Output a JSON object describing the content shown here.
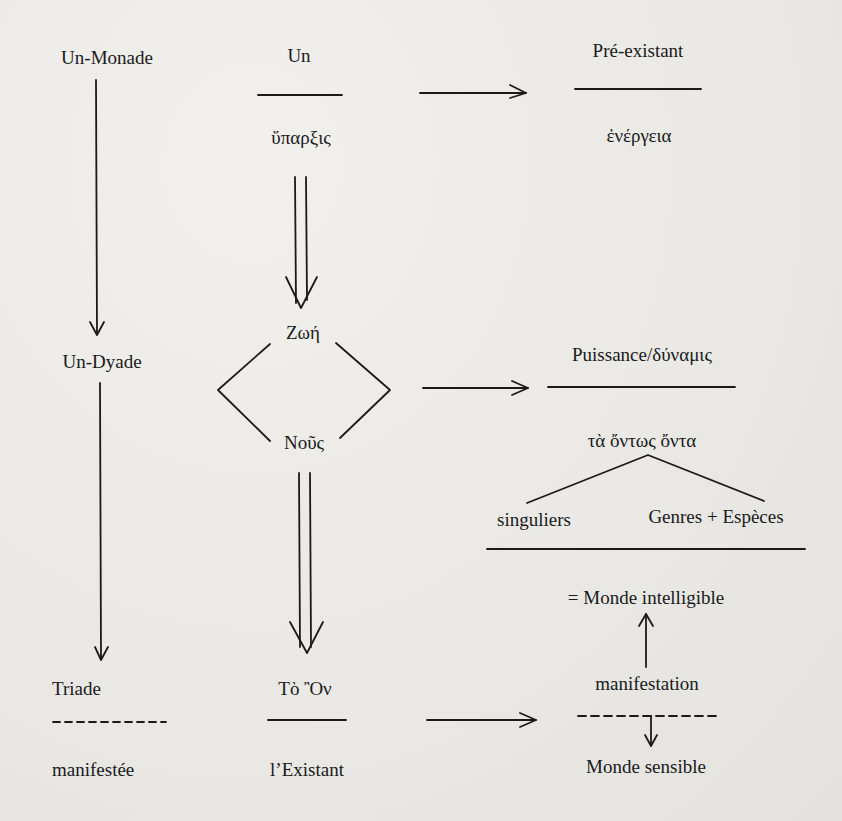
{
  "left_column": {
    "level1": "Un-Monade",
    "level2": "Un-Dyade",
    "level3_top": "Triade",
    "level3_bottom": "manifestée"
  },
  "middle_column": {
    "un_numerator": "Un",
    "un_denominator": "ὕπαρξις",
    "zoe": "Ζωή",
    "nous": "Νοῦς",
    "on_numerator": "Τὸ Ὂν",
    "on_denominator": "l’Existant"
  },
  "right_column": {
    "preexistant_numerator": "Pré-existant",
    "preexistant_denominator": "ἐνέργεια",
    "puissance_numerator": "Puissance/δύναμις",
    "ontos_onta": "τὰ ὄντως ὄντα",
    "branch_left": "singuliers",
    "branch_right": "Genres + Espèces",
    "monde_intelligible": "= Monde intelligible",
    "manifestation": "manifestation",
    "monde_sensible": "Monde sensible"
  },
  "colors": {
    "ink": "#1a1a1a",
    "paper": "#ecebe8"
  }
}
